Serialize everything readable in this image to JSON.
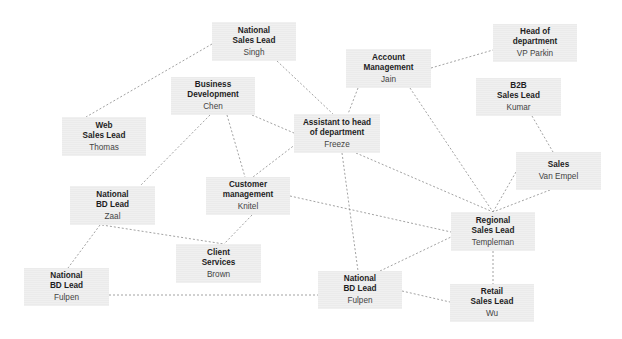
{
  "diagram": {
    "type": "org-network",
    "edge_style": "dashed",
    "colors": {
      "node_fill": "#ebebeb",
      "edge": "#8a8a8a",
      "background": "#ffffff"
    },
    "nodes": [
      {
        "id": "singh",
        "title": "National\nSales Lead",
        "person": "Singh",
        "x": 212,
        "y": 22,
        "w": 84,
        "h": 39
      },
      {
        "id": "chen",
        "title": "Business\nDevelopment",
        "person": "Chen",
        "x": 171,
        "y": 77,
        "w": 84,
        "h": 38
      },
      {
        "id": "thomas",
        "title": "Web\nSales Lead",
        "person": "Thomas",
        "x": 62,
        "y": 117,
        "w": 84,
        "h": 39
      },
      {
        "id": "jain",
        "title": "Account\nManagement",
        "person": "Jain",
        "x": 346,
        "y": 49,
        "w": 85,
        "h": 39
      },
      {
        "id": "parkin",
        "title": "Head of\ndepartment",
        "person": "VP Parkin",
        "x": 493,
        "y": 24,
        "w": 84,
        "h": 38
      },
      {
        "id": "kumar",
        "title": "B2B\nSales Lead",
        "person": "Kumar",
        "x": 476,
        "y": 78,
        "w": 85,
        "h": 38
      },
      {
        "id": "freeze",
        "title": "Assistant to head\nof department",
        "person": "Freeze",
        "x": 294,
        "y": 114,
        "w": 86,
        "h": 39
      },
      {
        "id": "vanempel",
        "title": "Sales",
        "person": "Van Empel",
        "x": 516,
        "y": 152,
        "w": 85,
        "h": 38
      },
      {
        "id": "knitel",
        "title": "Customer\nmanagement",
        "person": "Knitel",
        "x": 206,
        "y": 177,
        "w": 84,
        "h": 38
      },
      {
        "id": "zaal",
        "title": "National\nBD Lead",
        "person": "Zaal",
        "x": 70,
        "y": 186,
        "w": 85,
        "h": 39
      },
      {
        "id": "brown",
        "title": "Client\nServices",
        "person": "Brown",
        "x": 176,
        "y": 244,
        "w": 85,
        "h": 39
      },
      {
        "id": "templeman",
        "title": "Regional\nSales Lead",
        "person": "Templeman",
        "x": 451,
        "y": 212,
        "w": 84,
        "h": 39
      },
      {
        "id": "fulpen_left",
        "title": "National\nBD Lead",
        "person": "Fulpen",
        "x": 24,
        "y": 268,
        "w": 85,
        "h": 38
      },
      {
        "id": "fulpen_mid",
        "title": "National\nBD Lead",
        "person": "Fulpen",
        "x": 318,
        "y": 271,
        "w": 84,
        "h": 38
      },
      {
        "id": "wu",
        "title": "Retail\nSales Lead",
        "person": "Wu",
        "x": 450,
        "y": 284,
        "w": 84,
        "h": 38
      }
    ],
    "edges": [
      {
        "from": "singh",
        "to": "thomas",
        "x1": 212,
        "y1": 44,
        "x2": 86,
        "y2": 117
      },
      {
        "from": "singh",
        "to": "freeze",
        "x1": 277,
        "y1": 61,
        "x2": 333,
        "y2": 114
      },
      {
        "from": "chen",
        "to": "freeze",
        "x1": 252,
        "y1": 115,
        "x2": 294,
        "y2": 133
      },
      {
        "from": "chen",
        "to": "zaal",
        "x1": 210,
        "y1": 115,
        "x2": 140,
        "y2": 186
      },
      {
        "from": "chen",
        "to": "knitel",
        "x1": 227,
        "y1": 115,
        "x2": 245,
        "y2": 177
      },
      {
        "from": "freeze",
        "to": "knitel",
        "x1": 296,
        "y1": 144,
        "x2": 253,
        "y2": 177
      },
      {
        "from": "jain",
        "to": "freeze",
        "x1": 358,
        "y1": 88,
        "x2": 348,
        "y2": 114
      },
      {
        "from": "jain",
        "to": "parkin",
        "x1": 431,
        "y1": 68,
        "x2": 493,
        "y2": 50
      },
      {
        "from": "jain",
        "to": "templeman",
        "x1": 410,
        "y1": 88,
        "x2": 493,
        "y2": 212
      },
      {
        "from": "kumar",
        "to": "vanempel",
        "x1": 532,
        "y1": 116,
        "x2": 553,
        "y2": 152
      },
      {
        "from": "vanempel",
        "to": "templeman",
        "x1": 550,
        "y1": 190,
        "x2": 493,
        "y2": 212
      },
      {
        "from": "vanempel",
        "to": "templeman",
        "x1": 516,
        "y1": 172,
        "x2": 493,
        "y2": 212
      },
      {
        "from": "freeze",
        "to": "templeman",
        "x1": 356,
        "y1": 153,
        "x2": 493,
        "y2": 212
      },
      {
        "from": "freeze",
        "to": "fulpen_mid",
        "x1": 342,
        "y1": 153,
        "x2": 358,
        "y2": 271
      },
      {
        "from": "knitel",
        "to": "templeman",
        "x1": 290,
        "y1": 196,
        "x2": 451,
        "y2": 232
      },
      {
        "from": "knitel",
        "to": "brown",
        "x1": 252,
        "y1": 215,
        "x2": 224,
        "y2": 244
      },
      {
        "from": "zaal",
        "to": "brown",
        "x1": 102,
        "y1": 225,
        "x2": 224,
        "y2": 244
      },
      {
        "from": "zaal",
        "to": "fulpen_left",
        "x1": 100,
        "y1": 225,
        "x2": 68,
        "y2": 268
      },
      {
        "from": "fulpen_left",
        "to": "fulpen_mid",
        "x1": 109,
        "y1": 295,
        "x2": 318,
        "y2": 295
      },
      {
        "from": "fulpen_mid",
        "to": "templeman",
        "x1": 380,
        "y1": 271,
        "x2": 451,
        "y2": 237
      },
      {
        "from": "fulpen_mid",
        "to": "wu",
        "x1": 402,
        "y1": 291,
        "x2": 450,
        "y2": 302
      },
      {
        "from": "templeman",
        "to": "wu",
        "x1": 493,
        "y1": 251,
        "x2": 493,
        "y2": 284
      }
    ]
  }
}
